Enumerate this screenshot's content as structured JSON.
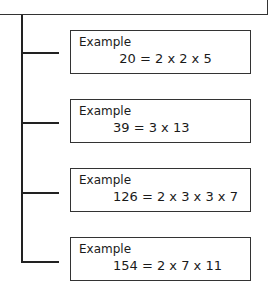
{
  "diagram": {
    "type": "tree",
    "examples": [
      {
        "label": "Example",
        "equation": "20 = 2 x 2 x 5"
      },
      {
        "label": "Example",
        "equation": "39 = 3 x 13"
      },
      {
        "label": "Example",
        "equation": "126 = 2 x 3 x 3 x 7"
      },
      {
        "label": "Example",
        "equation": "154 = 2 x 7 x 11"
      }
    ]
  }
}
